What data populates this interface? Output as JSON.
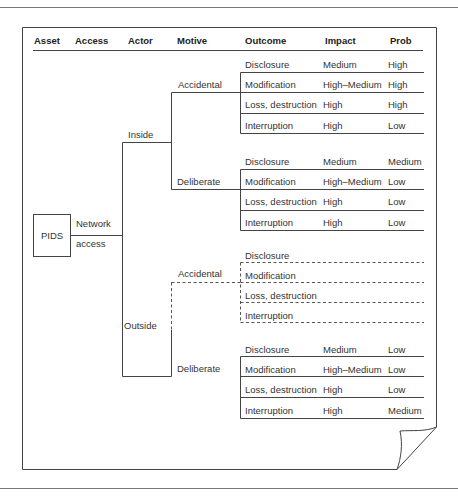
{
  "header": {
    "columns": [
      "Asset",
      "Access",
      "Actor",
      "Motive",
      "Outcome",
      "Impact",
      "Prob"
    ]
  },
  "asset": {
    "label": "PIDS"
  },
  "access": {
    "line1": "Network",
    "line2": "access"
  },
  "tree": {
    "inside": {
      "label": "Inside",
      "accidental": {
        "label": "Accidental",
        "rows": [
          {
            "outcome": "Disclosure",
            "impact": "Medium",
            "prob": "High"
          },
          {
            "outcome": "Modification",
            "impact": "High–Medium",
            "prob": "High"
          },
          {
            "outcome": "Loss, destruction",
            "impact": "High",
            "prob": "High"
          },
          {
            "outcome": "Interruption",
            "impact": "High",
            "prob": "Low"
          }
        ]
      },
      "deliberate": {
        "label": "Deliberate",
        "rows": [
          {
            "outcome": "Disclosure",
            "impact": "Medium",
            "prob": "Medium"
          },
          {
            "outcome": "Modification",
            "impact": "High–Medium",
            "prob": "Low"
          },
          {
            "outcome": "Loss, destruction",
            "impact": "High",
            "prob": "Low"
          },
          {
            "outcome": "Interruption",
            "impact": "High",
            "prob": "Low"
          }
        ]
      }
    },
    "outside": {
      "label": "Outside",
      "accidental": {
        "label": "Accidental",
        "rows": [
          {
            "outcome": "Disclosure",
            "impact": "",
            "prob": ""
          },
          {
            "outcome": "Modification",
            "impact": "",
            "prob": ""
          },
          {
            "outcome": "Loss, destruction",
            "impact": "",
            "prob": ""
          },
          {
            "outcome": "Interruption",
            "impact": "",
            "prob": ""
          }
        ]
      },
      "deliberate": {
        "label": "Deliberate",
        "rows": [
          {
            "outcome": "Disclosure",
            "impact": "Medium",
            "prob": "Low"
          },
          {
            "outcome": "Modification",
            "impact": "High–Medium",
            "prob": "Low"
          },
          {
            "outcome": "Loss, destruction",
            "impact": "High",
            "prob": "Low"
          },
          {
            "outcome": "Interruption",
            "impact": "High",
            "prob": "Medium"
          }
        ]
      }
    }
  },
  "colors": {
    "line": "#3a3a3a",
    "text": "#333333",
    "rule": "#555555"
  }
}
